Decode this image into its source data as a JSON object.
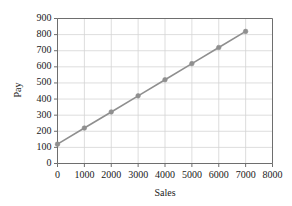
{
  "chart_data": {
    "type": "line",
    "title": "",
    "xlabel": "Sales",
    "ylabel": "Pay",
    "xlim": [
      0,
      8000
    ],
    "ylim": [
      0,
      900
    ],
    "xticks": [
      0,
      1000,
      2000,
      3000,
      4000,
      5000,
      6000,
      7000,
      8000
    ],
    "yticks": [
      0,
      100,
      200,
      300,
      400,
      500,
      600,
      700,
      800,
      900
    ],
    "xtick_labels": [
      "0",
      "1000",
      "2000",
      "3000",
      "4000",
      "5000",
      "6000",
      "7000",
      "8000"
    ],
    "ytick_labels": [
      "0",
      "100",
      "200",
      "300",
      "400",
      "500",
      "600",
      "700",
      "800",
      "900"
    ],
    "grid": true,
    "legend": "none",
    "series": [
      {
        "name": "Pay vs Sales",
        "x": [
          0,
          1000,
          2000,
          3000,
          4000,
          5000,
          6000,
          7000
        ],
        "values": [
          120,
          220,
          320,
          420,
          520,
          620,
          720,
          820
        ],
        "line_color": "#8f8f8f",
        "marker": "circle",
        "marker_color": "#8f8f8f"
      }
    ],
    "colors": {
      "line": "#8f8f8f",
      "marker": "#8f8f8f",
      "grid": "#d4d4d4",
      "axis": "#6e6e6e",
      "text": "#1a1a1a",
      "background": "#ffffff"
    }
  }
}
